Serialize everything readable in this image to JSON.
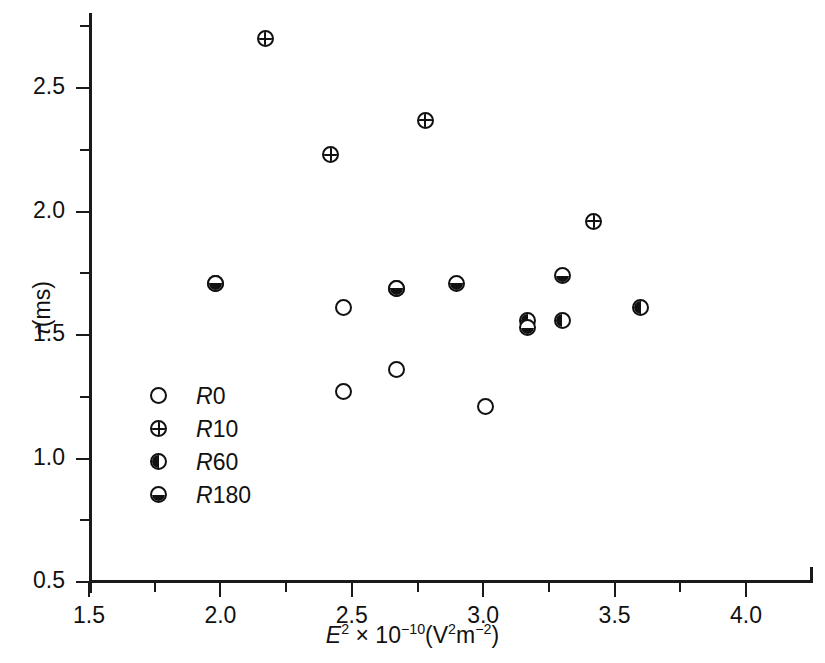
{
  "chart_data": {
    "type": "scatter",
    "title": "",
    "xlabel": "E² × 10⁻¹⁰(V²m⁻²)",
    "ylabel": "τ(ms)",
    "xlim": [
      1.5,
      4.25
    ],
    "ylim": [
      0.5,
      2.78
    ],
    "grid": false,
    "legend_position": "lower-left-inside",
    "x_ticks": [
      1.5,
      2.0,
      2.5,
      3.0,
      3.5,
      4.0
    ],
    "x_tick_labels": [
      "1.5",
      "2.0",
      "2.5",
      "3.0",
      "3.5",
      "4.0"
    ],
    "x_minor_ticks": [
      1.75,
      2.25,
      2.75,
      3.25,
      3.75
    ],
    "y_ticks": [
      0.5,
      1.0,
      1.5,
      2.0,
      2.5
    ],
    "y_tick_labels": [
      "0.5",
      "1.0",
      "1.5",
      "2.0",
      "2.5"
    ],
    "y_minor_ticks": [
      0.75,
      1.25,
      1.75,
      2.25,
      2.75
    ],
    "series": [
      {
        "name": "R0",
        "marker": "open-circle",
        "points": [
          {
            "x": 2.47,
            "y": 1.61
          },
          {
            "x": 2.47,
            "y": 1.27
          },
          {
            "x": 2.67,
            "y": 1.36
          },
          {
            "x": 3.01,
            "y": 1.21
          }
        ]
      },
      {
        "name": "R10",
        "marker": "cross-circle",
        "points": [
          {
            "x": 2.17,
            "y": 2.7
          },
          {
            "x": 2.42,
            "y": 2.23
          },
          {
            "x": 2.78,
            "y": 2.37
          },
          {
            "x": 3.42,
            "y": 1.96
          }
        ]
      },
      {
        "name": "R60",
        "marker": "left-half-filled-circle",
        "points": [
          {
            "x": 1.98,
            "y": 1.71
          },
          {
            "x": 2.67,
            "y": 1.69
          },
          {
            "x": 3.17,
            "y": 1.56
          },
          {
            "x": 3.3,
            "y": 1.56
          },
          {
            "x": 3.6,
            "y": 1.61
          }
        ]
      },
      {
        "name": "R180",
        "marker": "bottom-half-filled-circle",
        "points": [
          {
            "x": 1.98,
            "y": 1.71
          },
          {
            "x": 2.67,
            "y": 1.69
          },
          {
            "x": 2.9,
            "y": 1.71
          },
          {
            "x": 3.17,
            "y": 1.53
          },
          {
            "x": 3.3,
            "y": 1.74
          }
        ]
      }
    ]
  },
  "legend": {
    "entries": [
      {
        "label": "R0",
        "marker": "open-circle"
      },
      {
        "label": "R10",
        "marker": "cross-circle"
      },
      {
        "label": "R60",
        "marker": "left-half-filled-circle"
      },
      {
        "label": "R180",
        "marker": "bottom-half-filled-circle"
      }
    ]
  },
  "colors": {
    "ink": "#111111",
    "background": "#ffffff"
  }
}
